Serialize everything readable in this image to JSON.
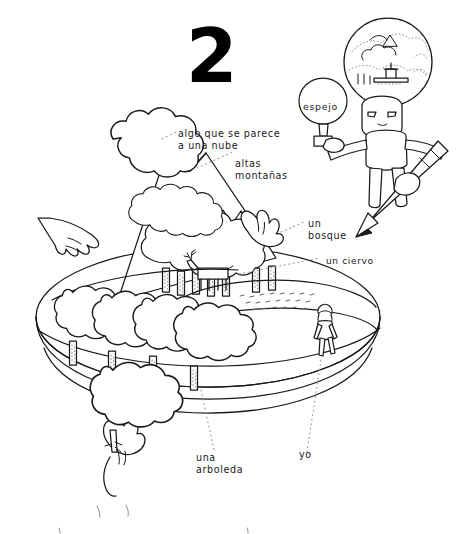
{
  "page": {
    "number": "2",
    "background_color": "#ffffff",
    "ink_color": "#1a1a1a",
    "language": "es"
  },
  "labels": {
    "cloud": "algo que se parece\na una nube",
    "mountains": "altas\nmontañas",
    "forest": "un\nbosque",
    "deer": "un ciervo",
    "grove": "una\narboleda",
    "self": "yo",
    "mirror": "espejo"
  },
  "icons": {
    "cloud": "cloud-icon",
    "mountain": "mountain-icon",
    "tree": "tree-icon",
    "deer": "deer-icon",
    "person": "person-icon",
    "hand": "hand-icon",
    "pencil": "pencil-icon",
    "mirror": "mirror-icon",
    "thought_head": "thought-bubble-head-icon"
  },
  "scene": {
    "title": "Paisaje sobre plataforma ovalada",
    "elements": [
      "nube",
      "montaña nevada",
      "bosque",
      "ciervo",
      "arboleda",
      "campo",
      "yo",
      "manos",
      "dibujante con espejo y lápiz"
    ]
  }
}
